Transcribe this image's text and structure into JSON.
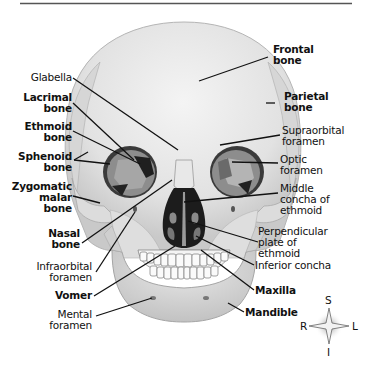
{
  "figure": {
    "orientation_compass": {
      "top": "S",
      "bottom": "I",
      "left": "R",
      "right": "L"
    }
  },
  "labels": {
    "frontal_bone": [
      "Frontal",
      "bone"
    ],
    "glabella": [
      "Glabella"
    ],
    "lacrimal_bone": [
      "Lacrimal",
      "bone"
    ],
    "parietal_bone": [
      "Parietal",
      "bone"
    ],
    "ethmoid_bone": [
      "Ethmoid",
      "bone"
    ],
    "supraorbital_foramen": [
      "Supraorbital",
      "foramen"
    ],
    "sphenoid_bone": [
      "Sphenoid",
      "bone"
    ],
    "optic_foramen": [
      "Optic",
      "foramen"
    ],
    "zygomatic_malar_bone": [
      "Zygomatic",
      "malar",
      "bone"
    ],
    "middle_concha": [
      "Middle",
      "concha of",
      "ethmoid"
    ],
    "nasal_bone": [
      "Nasal",
      "bone"
    ],
    "perpendicular_plate": [
      "Perpendicular",
      "plate of",
      "ethmoid"
    ],
    "infraorbital_foramen": [
      "Infraorbital",
      "foramen"
    ],
    "inferior_concha": [
      "Inferior concha"
    ],
    "vomer": [
      "Vomer"
    ],
    "maxilla": [
      "Maxilla"
    ],
    "mental_foramen": [
      "Mental",
      "foramen"
    ],
    "mandible": [
      "Mandible"
    ]
  },
  "colors": {
    "bone_light": "#ececec",
    "bone_mid": "#d4d4d4",
    "bone_shadow": "#a9a9a9",
    "orbit_fill": "#8e8e8e",
    "cavity_dark": "#1e1e1e",
    "leader_line": "#111111",
    "rule": "#555555"
  }
}
